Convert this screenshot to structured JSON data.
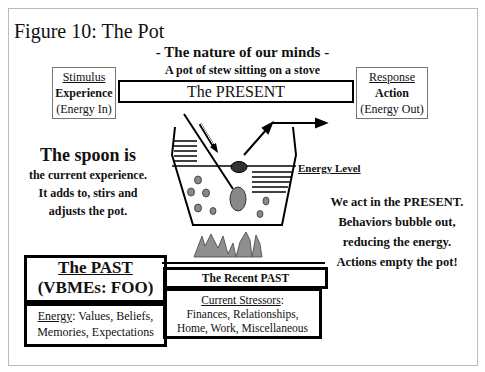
{
  "figure": {
    "title": "Figure 10: The Pot",
    "subtitle": "- The nature of our minds -",
    "caption": "A pot of stew sitting on a stove"
  },
  "stimulus_box": {
    "heading": "Stimulus",
    "label": "Experience",
    "note": "(Energy In)"
  },
  "response_box": {
    "heading": "Response",
    "label": "Action",
    "note": "(Energy Out)"
  },
  "present_bar": {
    "label": "The PRESENT"
  },
  "spoon_text": {
    "headline": "The spoon is",
    "lines": [
      "the current experience.",
      "It adds to, stirs and",
      "adjusts the pot."
    ]
  },
  "energy_level": {
    "label": "Energy Level"
  },
  "action_text": {
    "lines": [
      "We act in the PRESENT.",
      "Behaviors bubble out,",
      "reducing the energy.",
      "Actions empty the pot!"
    ]
  },
  "past_box": {
    "line1": "The PAST",
    "line2": "(VBMEs: FOO)"
  },
  "past_energy": {
    "label": "Energy",
    "text1": ": Values, Beliefs,",
    "text2": "Memories, Expectations"
  },
  "recent_past": {
    "label": "The Recent PAST"
  },
  "stressors": {
    "label": "Current Stressors",
    "colon": ":",
    "line1": "Finances, Relationships,",
    "line2": "Home, Work, Miscellaneous"
  },
  "colors": {
    "ink": "#000000",
    "fill_gray": "#8a8a8a",
    "frame": "#bbbbbb"
  }
}
